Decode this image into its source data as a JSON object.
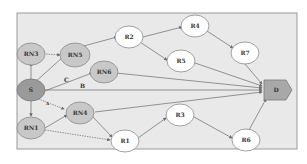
{
  "diagram": {
    "colors": {
      "frame_fill": "#e9e9e9",
      "frame_stroke": "#9a9a9a",
      "relay_fill": "#ffffff",
      "relay_node_fill": "#c8c8c8",
      "source_fill": "#9a9a9a",
      "dest_fill": "#a8a8a8",
      "edge": "#6a6a6a"
    },
    "nodes": {
      "rn3": {
        "label": "RN3"
      },
      "rn5": {
        "label": "RN5"
      },
      "s": {
        "label": "S"
      },
      "rn1": {
        "label": "RN1"
      },
      "rn4": {
        "label": "RN4"
      },
      "rn6": {
        "label": "RN6"
      },
      "r2": {
        "label": "R2"
      },
      "r4": {
        "label": "R4"
      },
      "r7": {
        "label": "R7"
      },
      "r5": {
        "label": "R5"
      },
      "r1": {
        "label": "R1"
      },
      "r3": {
        "label": "R3"
      },
      "r6": {
        "label": "R6"
      },
      "d": {
        "label": "D"
      }
    },
    "edge_labels": {
      "a": "A",
      "b": "B",
      "c": "C"
    }
  }
}
